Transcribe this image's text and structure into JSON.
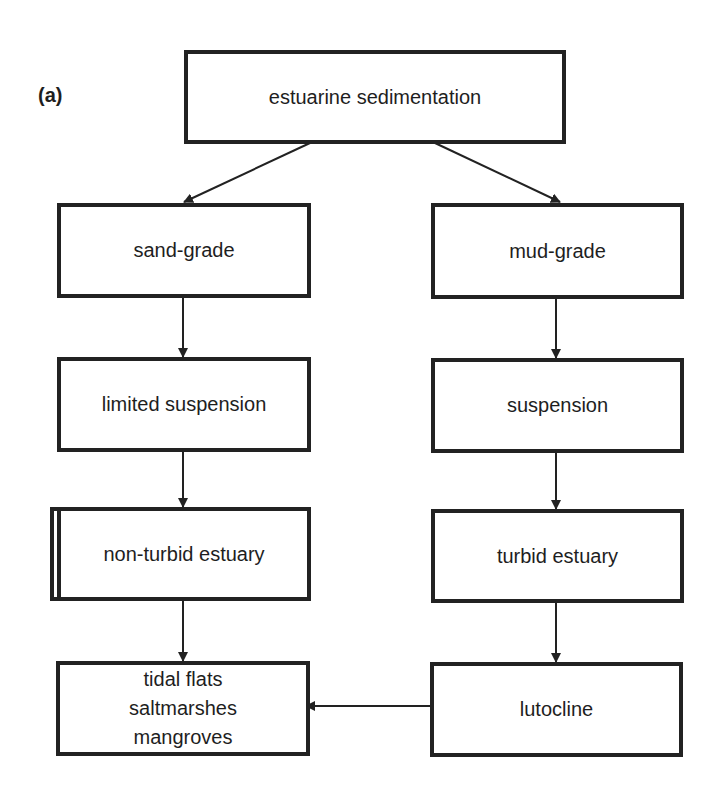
{
  "panel_label": "(a)",
  "nodes": {
    "root": "estuarine sedimentation",
    "sand": "sand-grade",
    "mud": "mud-grade",
    "limited": "limited suspension",
    "suspension": "suspension",
    "nonturbid": "non-turbid estuary",
    "turbid": "turbid estuary",
    "tidal_l1": "tidal flats",
    "tidal_l2": "saltmarshes",
    "tidal_l3": "mangroves",
    "lutocline": "lutocline"
  },
  "edges": [
    [
      "estuarine sedimentation",
      "sand-grade"
    ],
    [
      "estuarine sedimentation",
      "mud-grade"
    ],
    [
      "sand-grade",
      "limited suspension"
    ],
    [
      "limited suspension",
      "non-turbid estuary"
    ],
    [
      "non-turbid estuary",
      "tidal flats / saltmarshes / mangroves"
    ],
    [
      "mud-grade",
      "suspension"
    ],
    [
      "suspension",
      "turbid estuary"
    ],
    [
      "turbid estuary",
      "lutocline"
    ],
    [
      "lutocline",
      "tidal flats / saltmarshes / mangroves"
    ]
  ]
}
